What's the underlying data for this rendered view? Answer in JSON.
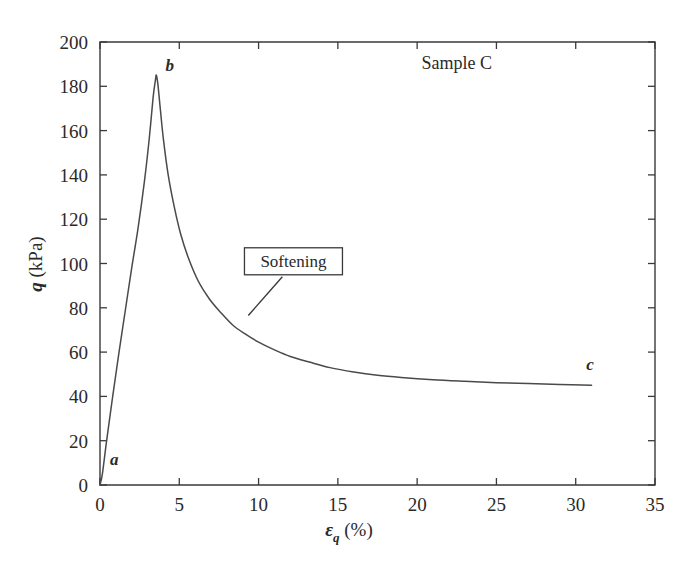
{
  "chart_data": {
    "type": "line",
    "title": "",
    "xlabel": "εq (%)",
    "xlabel_symbol": "ε",
    "xlabel_sub": "q",
    "xlabel_unit": "(%)",
    "ylabel": "q (kPa)",
    "ylabel_symbol": "q",
    "ylabel_unit": "(kPa)",
    "xlim": [
      0,
      35
    ],
    "ylim": [
      0,
      200
    ],
    "xticks": [
      0,
      5,
      10,
      15,
      20,
      25,
      30,
      35
    ],
    "yticks": [
      0,
      20,
      40,
      60,
      80,
      100,
      120,
      140,
      160,
      180,
      200
    ],
    "xtick_labels": [
      "0",
      "5",
      "10",
      "15",
      "20",
      "25",
      "30",
      "35"
    ],
    "ytick_labels": [
      "0",
      "20",
      "40",
      "60",
      "80",
      "100",
      "120",
      "140",
      "160",
      "180",
      "200"
    ],
    "grid": false,
    "legend": null,
    "series": [
      {
        "name": "Sample C stress-strain",
        "color": "#4a4a4a",
        "x": [
          0.0,
          0.15,
          0.4,
          0.8,
          1.2,
          1.6,
          2.0,
          2.4,
          2.8,
          3.1,
          3.35,
          3.5,
          3.55,
          3.65,
          3.8,
          4.0,
          4.3,
          4.7,
          5.1,
          5.6,
          6.2,
          6.9,
          7.6,
          8.4,
          9.2,
          10.0,
          11.0,
          12.0,
          13.2,
          14.5,
          16.0,
          17.5,
          19.0,
          21.0,
          23.0,
          25.0,
          27.0,
          29.0,
          31.0
        ],
        "y": [
          0.0,
          5.0,
          19.0,
          40.0,
          60.0,
          79.0,
          98.0,
          116.0,
          137.0,
          156.0,
          175.0,
          183.0,
          185.0,
          181.0,
          170.0,
          156.0,
          140.0,
          125.0,
          113.0,
          102.0,
          92.0,
          84.0,
          78.0,
          72.0,
          68.0,
          64.5,
          61.0,
          58.0,
          55.5,
          53.0,
          51.0,
          49.5,
          48.5,
          47.5,
          46.8,
          46.2,
          45.8,
          45.4,
          45.0
        ]
      }
    ],
    "point_labels": [
      {
        "id": "a",
        "text": "a",
        "x": 0.9,
        "y": 9,
        "desc": "start of loading"
      },
      {
        "id": "b",
        "text": "b",
        "x": 4.4,
        "y": 187,
        "desc": "peak deviator stress"
      },
      {
        "id": "c",
        "text": "c",
        "x": 30.9,
        "y": 52,
        "desc": "residual state"
      }
    ],
    "annotations": [
      {
        "id": "sample",
        "text": "Sample C",
        "x": 22.5,
        "y": 188,
        "boxed": false
      },
      {
        "id": "softening",
        "text": "Softening",
        "x": 12.2,
        "y": 101,
        "boxed": true,
        "leader_from_x": 11.5,
        "leader_from_y": 94,
        "leader_to_x": 9.35,
        "leader_to_y": 76.5
      }
    ]
  }
}
